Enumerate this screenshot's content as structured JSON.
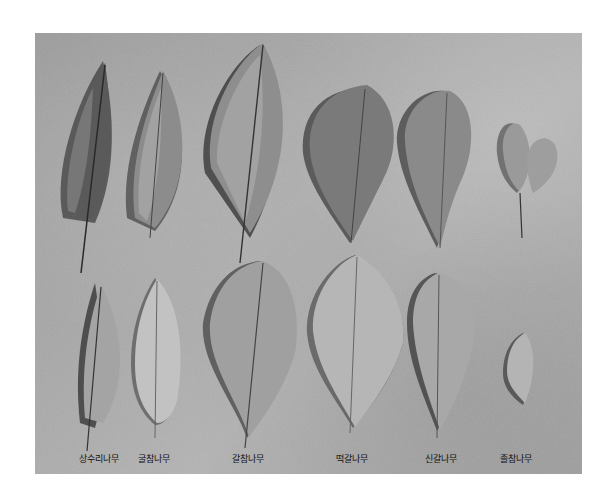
{
  "figure": {
    "background_color": "#ffffff",
    "photo_tone": "#a6a6a6",
    "labels": [
      {
        "text": "상수리나무",
        "x": 64
      },
      {
        "text": "굴참나무",
        "x": 119
      },
      {
        "text": "갈참나무",
        "x": 213
      },
      {
        "text": "떡갈나무",
        "x": 317
      },
      {
        "text": "신갈나무",
        "x": 406
      },
      {
        "text": "졸참나무",
        "x": 481
      }
    ]
  }
}
